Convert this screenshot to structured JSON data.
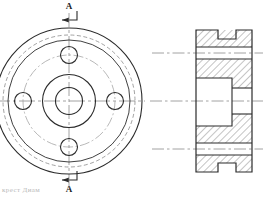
{
  "drawing": {
    "title": "Flange / hub engineering drawing",
    "sheet_background": "#ffffff",
    "line_color": "#2b2b2b",
    "thin_line_color": "#6b6b6b",
    "hidden_line_color": "#8a8a8a",
    "center_line_color": "#8a8a8a",
    "hatch_color": "#555555"
  },
  "section_marks": {
    "top_label": "A",
    "bottom_label": "A",
    "arrow_direction": "right"
  },
  "front_view": {
    "name": "front-view",
    "center": {
      "x": 69,
      "y": 101
    },
    "outer_diameter_px": 146,
    "hidden_circle_diameter_px": 132,
    "inner_face_diameter_px": 122,
    "bolt_circle_diameter_px": 92,
    "hub_outer_diameter_px": 53,
    "bore_diameter_px": 27,
    "bolt_hole_count": 4,
    "bolt_hole_diameter_px": 17,
    "bolt_hole_angles_deg": [
      90,
      0,
      270,
      180
    ]
  },
  "section_view": {
    "name": "section-view-a-a",
    "left_px": 196,
    "right_px": 252,
    "top_px": 30,
    "bottom_px": 172,
    "center_y_px": 101,
    "top_notch": {
      "x1": 218,
      "x2": 236,
      "depth_px": 9
    },
    "bottom_notch": {
      "x1": 218,
      "x2": 236,
      "depth_px": 9
    },
    "upper_bolt_gap": {
      "y1": 47,
      "y2": 59
    },
    "lower_bolt_gap": {
      "y1": 143,
      "y2": 155
    },
    "counterbore": {
      "x1": 196,
      "x2": 232,
      "y1": 78,
      "y2": 126
    },
    "bore": {
      "x1": 232,
      "x2": 252,
      "y1": 88,
      "y2": 114
    }
  },
  "caption": {
    "text": "крест Диам"
  }
}
